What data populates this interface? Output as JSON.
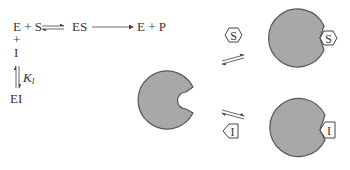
{
  "scheme": {
    "reactants": "E + S",
    "complex": "ES",
    "products": "E + P",
    "plus": "+",
    "inhibitor": "I",
    "constant_symbol": "K",
    "constant_subscript": "I",
    "inhibited_complex": "EI"
  },
  "illustration": {
    "substrate_label": "S",
    "inhibitor_label": "I",
    "bound_substrate_label": "S",
    "bound_inhibitor_label": "I"
  },
  "colors": {
    "enzyme_fill": "#a8a8a8",
    "enzyme_stroke": "#555555",
    "text": "#333333",
    "arrow": "#444444"
  }
}
